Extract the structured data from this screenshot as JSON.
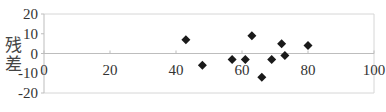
{
  "chart_data": {
    "type": "scatter",
    "title": "",
    "xlabel": "",
    "ylabel": "残差",
    "ylabel_chars": [
      "残",
      "差"
    ],
    "xlim": [
      0,
      100
    ],
    "ylim": [
      -20,
      20
    ],
    "x_ticks": [
      0,
      20,
      40,
      60,
      80,
      100
    ],
    "y_ticks": [
      20,
      10,
      0,
      -10,
      -20
    ],
    "x_tick_labels": [
      "0",
      "20",
      "40",
      "60",
      "80",
      "100"
    ],
    "y_tick_labels": [
      "20",
      "10",
      "0",
      "-10",
      "-20"
    ],
    "grid": false,
    "legend": null,
    "marker": "diamond",
    "colors": {
      "marker": "#1a1a1a",
      "axis": "#bdbdbd",
      "frame": "#d6d6d6"
    },
    "series": [
      {
        "name": "残差",
        "points": [
          {
            "x": 43,
            "y": 7
          },
          {
            "x": 48,
            "y": -6
          },
          {
            "x": 57,
            "y": -3
          },
          {
            "x": 61,
            "y": -3
          },
          {
            "x": 63,
            "y": 9
          },
          {
            "x": 66,
            "y": -12
          },
          {
            "x": 69,
            "y": -3
          },
          {
            "x": 72,
            "y": 5
          },
          {
            "x": 73,
            "y": -1
          },
          {
            "x": 80,
            "y": 4
          }
        ]
      }
    ]
  }
}
